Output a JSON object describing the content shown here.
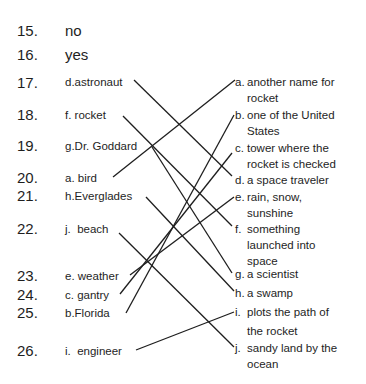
{
  "answers": {
    "q15": {
      "number": "15.",
      "text": "no"
    },
    "q16": {
      "number": "16.",
      "text": "yes"
    }
  },
  "matching": {
    "numbers": [
      "17.",
      "18.",
      "19.",
      "20.",
      "21.",
      "22.",
      "23.",
      "24.",
      "25.",
      "26."
    ],
    "left": [
      {
        "letter": "d.",
        "term": "astronaut"
      },
      {
        "letter": "f.",
        "term": "rocket"
      },
      {
        "letter": "g.",
        "term": "Dr. Goddard"
      },
      {
        "letter": "a.",
        "term": "bird"
      },
      {
        "letter": "h.",
        "term": "Everglades"
      },
      {
        "letter": "j.",
        "term": "beach"
      },
      {
        "letter": "e.",
        "term": "weather"
      },
      {
        "letter": "c.",
        "term": "gantry"
      },
      {
        "letter": "b.",
        "term": "Florida"
      },
      {
        "letter": "i.",
        "term": "engineer"
      }
    ],
    "right": [
      {
        "letter": "a.",
        "line1": "another name for",
        "line2": "rocket"
      },
      {
        "letter": "b.",
        "line1": "one of the United",
        "line2": "States"
      },
      {
        "letter": "c.",
        "line1": "tower where the",
        "line2": "rocket is checked"
      },
      {
        "letter": "d.",
        "line1": "a space traveler",
        "line2": ""
      },
      {
        "letter": "e.",
        "line1": "rain, snow,",
        "line2": "sunshine"
      },
      {
        "letter": "f.",
        "line1": "something",
        "line2": "launched into",
        "line3": "space"
      },
      {
        "letter": "g.",
        "line1": "a scientist",
        "line2": ""
      },
      {
        "letter": "h.",
        "line1": "a swamp",
        "line2": ""
      },
      {
        "letter": "i.",
        "line1": "plots the path of",
        "line2": "the rocket"
      },
      {
        "letter": "j.",
        "line1": "sandy land by the",
        "line2": "ocean"
      }
    ],
    "connections": [
      {
        "from": "astronaut",
        "to": "d"
      },
      {
        "from": "rocket",
        "to": "f"
      },
      {
        "from": "Dr. Goddard",
        "to": "g"
      },
      {
        "from": "bird",
        "to": "a"
      },
      {
        "from": "Everglades",
        "to": "h"
      },
      {
        "from": "beach",
        "to": "j"
      },
      {
        "from": "weather",
        "to": "e"
      },
      {
        "from": "gantry",
        "to": "c"
      },
      {
        "from": "Florida",
        "to": "b"
      },
      {
        "from": "engineer",
        "to": "i"
      }
    ]
  }
}
